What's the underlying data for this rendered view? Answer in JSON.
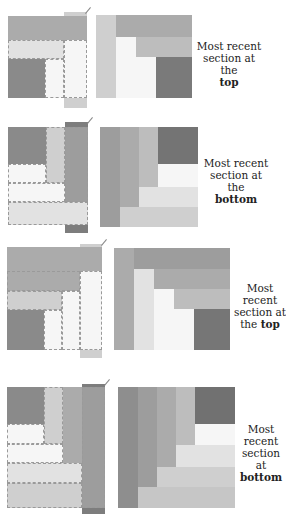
{
  "diagrams": [
    {
      "id": 1,
      "caption_line1": "Most recent",
      "caption_line2": "section at the",
      "caption_bold": "top"
    },
    {
      "id": 2,
      "caption_line1": "Most recent",
      "caption_line2": "section at the",
      "caption_bold": "bottom"
    },
    {
      "id": 3,
      "caption_line1": "Most",
      "caption_line2": "recent",
      "caption_line3": "section at",
      "caption_line4_prefix": "the ",
      "caption_bold": "top"
    },
    {
      "id": 4,
      "caption_line1": "Most",
      "caption_line2": "recent",
      "caption_line3": "section at",
      "caption_bold": "bottom"
    }
  ],
  "colors": {
    "darkest": "#8a8a8a",
    "dark": "#9d9d9d",
    "medium": "#ababab",
    "medium_light": "#bdbdbd",
    "light": "#cfcfcf",
    "lighter": "#e2e2e2",
    "white": "#f6f6f6"
  }
}
